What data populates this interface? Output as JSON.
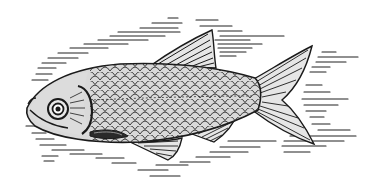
{
  "image": {
    "subject": "fish",
    "style": "black-and-white engraving illustration",
    "colors": {
      "background": "#ffffff",
      "ink": "#1a1a1a",
      "body_fill": "#d9d9d9",
      "fin_fill": "#e6e6e6"
    }
  }
}
